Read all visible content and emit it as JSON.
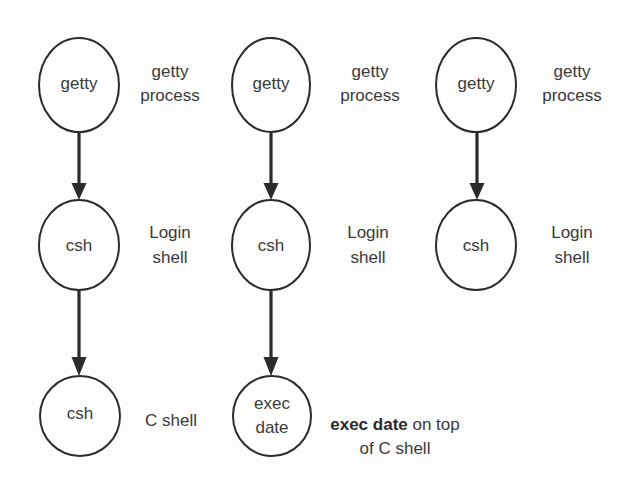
{
  "diagram": {
    "type": "process-tree",
    "colors": {
      "stroke": "#2b2b2b",
      "text": "#3a3a3a",
      "background": "#fdfdfd"
    },
    "columns": [
      {
        "nodes": [
          {
            "id": "c1n1",
            "label": "getty",
            "side_label": [
              "getty",
              "process"
            ]
          },
          {
            "id": "c1n2",
            "label": "csh",
            "side_label": [
              "Login",
              "shell"
            ]
          },
          {
            "id": "c1n3",
            "label": "csh",
            "side_label": [
              "C shell"
            ]
          }
        ],
        "edges": [
          [
            "c1n1",
            "c1n2"
          ],
          [
            "c1n2",
            "c1n3"
          ]
        ]
      },
      {
        "nodes": [
          {
            "id": "c2n1",
            "label": "getty",
            "side_label": [
              "getty",
              "process"
            ]
          },
          {
            "id": "c2n2",
            "label": "csh",
            "side_label": [
              "Login",
              "shell"
            ]
          },
          {
            "id": "c2n3",
            "label_lines": [
              "exec",
              "date"
            ],
            "side_label_bold": "exec date",
            "side_label_rest": " on top",
            "side_label_line2": "of C shell"
          }
        ],
        "edges": [
          [
            "c2n1",
            "c2n2"
          ],
          [
            "c2n2",
            "c2n3"
          ]
        ]
      },
      {
        "nodes": [
          {
            "id": "c3n1",
            "label": "getty",
            "side_label": [
              "getty",
              "process"
            ]
          },
          {
            "id": "c3n2",
            "label": "csh",
            "side_label": [
              "Login",
              "shell"
            ]
          }
        ],
        "edges": [
          [
            "c3n1",
            "c3n2"
          ]
        ]
      }
    ]
  }
}
